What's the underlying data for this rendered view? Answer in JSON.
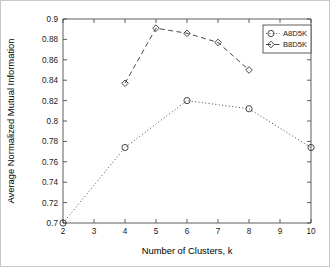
{
  "chart_data": {
    "type": "line",
    "title": "",
    "xlabel": "Number of Clusters, k",
    "ylabel": "Average Normalized Mutual Information",
    "xlim": [
      2,
      10
    ],
    "ylim": [
      0.7,
      0.9
    ],
    "grid": false,
    "legend_position": "top-right",
    "xticks": [
      "2",
      "3",
      "4",
      "5",
      "6",
      "7",
      "8",
      "9",
      "10"
    ],
    "xtick_values": [
      2,
      3,
      4,
      5,
      6,
      7,
      8,
      9,
      10
    ],
    "yticks": [
      "0.7",
      "0.72",
      "0.74",
      "0.76",
      "0.78",
      "0.8",
      "0.82",
      "0.84",
      "0.86",
      "0.88",
      "0.9"
    ],
    "ytick_values": [
      0.7,
      0.72,
      0.74,
      0.76,
      0.78,
      0.8,
      0.82,
      0.84,
      0.86,
      0.88,
      0.9
    ],
    "series": [
      {
        "name": "A8D5K",
        "linestyle": "dotted",
        "marker": "circle",
        "color": "#333333",
        "x": [
          2,
          4,
          6,
          8,
          10
        ],
        "values": [
          0.7,
          0.774,
          0.82,
          0.812,
          0.774
        ]
      },
      {
        "name": "B8D5K",
        "linestyle": "dashed",
        "marker": "diamond",
        "color": "#333333",
        "x": [
          4,
          5,
          6,
          7,
          8
        ],
        "values": [
          0.837,
          0.891,
          0.886,
          0.877,
          0.85
        ]
      }
    ]
  },
  "legend": {
    "entries": [
      {
        "label": "A8D5K"
      },
      {
        "label": "B8D5K"
      }
    ]
  }
}
